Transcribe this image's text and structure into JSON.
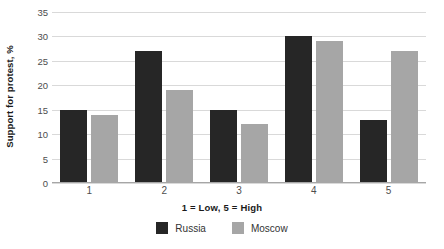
{
  "chart_data": {
    "type": "bar",
    "title": "",
    "xlabel": "1 = Low, 5 = High",
    "ylabel": "Support for protest, %",
    "categories": [
      "1",
      "2",
      "3",
      "4",
      "5"
    ],
    "series": [
      {
        "name": "Russia",
        "color": "#262626",
        "values": [
          15,
          27,
          15,
          30,
          13
        ]
      },
      {
        "name": "Moscow",
        "color": "#a6a6a6",
        "values": [
          14,
          19,
          12,
          29,
          27
        ]
      }
    ],
    "ylim": [
      0,
      35
    ],
    "ytick_step": 5,
    "yticks": [
      "0",
      "5",
      "10",
      "15",
      "20",
      "25",
      "30",
      "35"
    ],
    "grid": true,
    "legend_position": "bottom-center"
  },
  "axes": {
    "y_title": "Support for protest, %",
    "x_title": "1 = Low, 5 = High"
  },
  "legend": {
    "items": [
      {
        "label": "Russia",
        "color": "#262626"
      },
      {
        "label": "Moscow",
        "color": "#a6a6a6"
      }
    ]
  }
}
